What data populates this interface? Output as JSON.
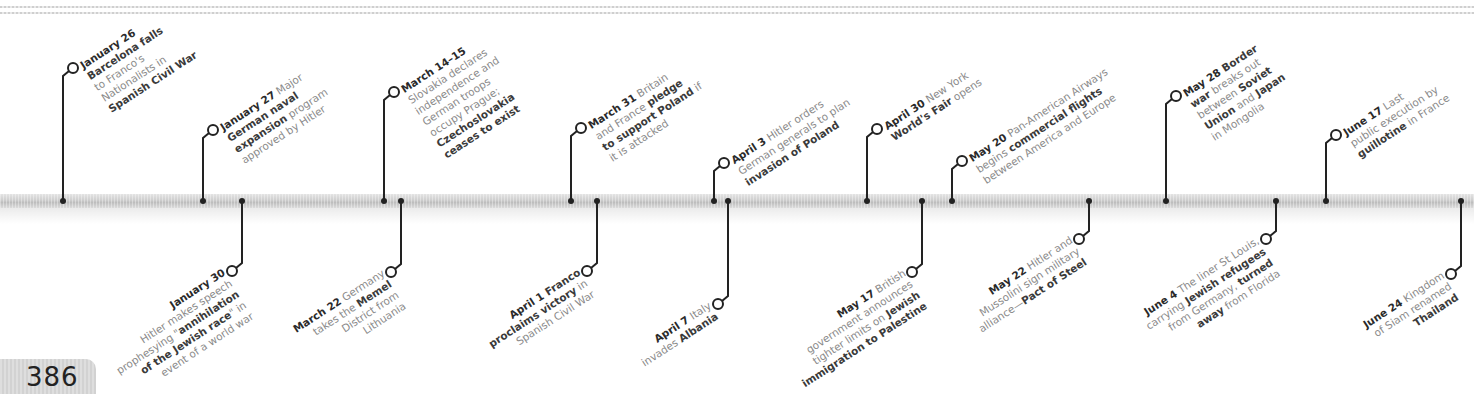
{
  "page_number": "386",
  "colors": {
    "text_bold": "#2a2a2a",
    "text_regular": "#8a8a8a",
    "bar": "#cdcdcd",
    "line": "#222222"
  },
  "events_above": [
    {
      "id": "jan26",
      "x": 63,
      "lines": [
        [
          {
            "t": "January 26",
            "s": "date"
          }
        ],
        [
          {
            "t": "Barcelona falls",
            "s": "bold"
          }
        ],
        [
          {
            "t": "to Franco's",
            "s": "reg"
          }
        ],
        [
          {
            "t": "Nationalists in",
            "s": "reg"
          }
        ],
        [
          {
            "t": "Spanish Civil War",
            "s": "bold"
          }
        ]
      ]
    },
    {
      "id": "jan27",
      "x": 203,
      "lines": [
        [
          {
            "t": "January 27",
            "s": "date"
          },
          {
            "t": " Major",
            "s": "reg"
          }
        ],
        [
          {
            "t": "German naval",
            "s": "bold"
          }
        ],
        [
          {
            "t": "expansion",
            "s": "bold"
          },
          {
            "t": " program",
            "s": "reg"
          }
        ],
        [
          {
            "t": "approved by Hitler",
            "s": "reg"
          }
        ]
      ]
    },
    {
      "id": "mar14",
      "x": 384,
      "lines": [
        [
          {
            "t": "March 14–15",
            "s": "date"
          }
        ],
        [
          {
            "t": "Slovakia declares",
            "s": "reg"
          }
        ],
        [
          {
            "t": "independence and",
            "s": "reg"
          }
        ],
        [
          {
            "t": "German troops",
            "s": "reg"
          }
        ],
        [
          {
            "t": "occupy Prague;",
            "s": "reg"
          }
        ],
        [
          {
            "t": "Czechoslovakia",
            "s": "bold"
          }
        ],
        [
          {
            "t": "ceases to exist",
            "s": "bold"
          }
        ]
      ]
    },
    {
      "id": "mar31",
      "x": 571,
      "lines": [
        [
          {
            "t": "March 31",
            "s": "date"
          },
          {
            "t": " Britain",
            "s": "reg"
          }
        ],
        [
          {
            "t": "and France ",
            "s": "reg"
          },
          {
            "t": "pledge",
            "s": "bold"
          }
        ],
        [
          {
            "t": "to support Poland",
            "s": "bold"
          },
          {
            "t": " if",
            "s": "reg"
          }
        ],
        [
          {
            "t": "it is attacked",
            "s": "reg"
          }
        ]
      ]
    },
    {
      "id": "apr3",
      "x": 714,
      "lines": [
        [
          {
            "t": "April 3",
            "s": "date"
          },
          {
            "t": " Hitler orders",
            "s": "reg"
          }
        ],
        [
          {
            "t": "German generals to plan",
            "s": "reg"
          }
        ],
        [
          {
            "t": "invasion of Poland",
            "s": "bold"
          }
        ]
      ]
    },
    {
      "id": "apr30",
      "x": 867,
      "lines": [
        [
          {
            "t": "April 30",
            "s": "date"
          },
          {
            "t": " New York",
            "s": "reg"
          }
        ],
        [
          {
            "t": "World's Fair",
            "s": "bold"
          },
          {
            "t": " opens",
            "s": "reg"
          }
        ]
      ]
    },
    {
      "id": "may20",
      "x": 952,
      "lines": [
        [
          {
            "t": "May 20",
            "s": "date"
          },
          {
            "t": " Pan-American Airways",
            "s": "reg"
          }
        ],
        [
          {
            "t": "begins ",
            "s": "reg"
          },
          {
            "t": "commercial flights",
            "s": "bold"
          }
        ],
        [
          {
            "t": "between America and Europe",
            "s": "reg"
          }
        ]
      ]
    },
    {
      "id": "may28",
      "x": 1166,
      "lines": [
        [
          {
            "t": "May 28",
            "s": "date"
          },
          {
            "t": " Border",
            "s": "bold"
          }
        ],
        [
          {
            "t": "war",
            "s": "bold"
          },
          {
            "t": " breaks out",
            "s": "reg"
          }
        ],
        [
          {
            "t": "between ",
            "s": "reg"
          },
          {
            "t": "Soviet",
            "s": "bold"
          }
        ],
        [
          {
            "t": "Union",
            "s": "bold"
          },
          {
            "t": " and ",
            "s": "reg"
          },
          {
            "t": "Japan",
            "s": "bold"
          }
        ],
        [
          {
            "t": "in Mongolia",
            "s": "reg"
          }
        ]
      ]
    },
    {
      "id": "jun17",
      "x": 1326,
      "lines": [
        [
          {
            "t": "June 17",
            "s": "date"
          },
          {
            "t": " Last",
            "s": "reg"
          }
        ],
        [
          {
            "t": "public execution by",
            "s": "reg"
          }
        ],
        [
          {
            "t": "guillotine",
            "s": "bold"
          },
          {
            "t": " in France",
            "s": "reg"
          }
        ]
      ]
    }
  ],
  "events_below": [
    {
      "id": "jan30",
      "x": 242,
      "lines": [
        [
          {
            "t": "January 30",
            "s": "date"
          }
        ],
        [
          {
            "t": "Hitler makes speech",
            "s": "reg"
          }
        ],
        [
          {
            "t": "prophesying \"",
            "s": "reg"
          },
          {
            "t": "annihilation",
            "s": "bold"
          }
        ],
        [
          {
            "t": "of the Jewish race",
            "s": "bold"
          },
          {
            "t": "\" in",
            "s": "reg"
          }
        ],
        [
          {
            "t": "event of a world war",
            "s": "reg"
          }
        ]
      ]
    },
    {
      "id": "mar22",
      "x": 401,
      "lines": [
        [
          {
            "t": "March 22",
            "s": "date"
          },
          {
            "t": " Germany",
            "s": "reg"
          }
        ],
        [
          {
            "t": "takes the ",
            "s": "reg"
          },
          {
            "t": "Memel",
            "s": "bold"
          }
        ],
        [
          {
            "t": "District from",
            "s": "reg"
          }
        ],
        [
          {
            "t": "Lithuania",
            "s": "reg"
          }
        ]
      ]
    },
    {
      "id": "apr1",
      "x": 597,
      "lines": [
        [
          {
            "t": "April 1",
            "s": "date"
          },
          {
            "t": " Franco",
            "s": "bold"
          }
        ],
        [
          {
            "t": "proclaims victory",
            "s": "bold"
          },
          {
            "t": " in",
            "s": "reg"
          }
        ],
        [
          {
            "t": "Spanish Civil War",
            "s": "reg"
          }
        ]
      ]
    },
    {
      "id": "apr7",
      "x": 728,
      "lines": [
        [
          {
            "t": "April 7",
            "s": "date"
          },
          {
            "t": " Italy",
            "s": "reg"
          }
        ],
        [
          {
            "t": "invades ",
            "s": "reg"
          },
          {
            "t": "Albania",
            "s": "bold"
          }
        ]
      ]
    },
    {
      "id": "may17",
      "x": 922,
      "lines": [
        [
          {
            "t": "May 17",
            "s": "date"
          },
          {
            "t": " British",
            "s": "reg"
          }
        ],
        [
          {
            "t": "government announces",
            "s": "reg"
          }
        ],
        [
          {
            "t": "tighter limits on ",
            "s": "reg"
          },
          {
            "t": "Jewish",
            "s": "bold"
          }
        ],
        [
          {
            "t": "immigration to Palestine",
            "s": "bold"
          }
        ]
      ]
    },
    {
      "id": "may22",
      "x": 1089,
      "lines": [
        [
          {
            "t": "May 22",
            "s": "date"
          },
          {
            "t": " Hitler and",
            "s": "reg"
          }
        ],
        [
          {
            "t": "Mussolini sign military",
            "s": "reg"
          }
        ],
        [
          {
            "t": "alliance—",
            "s": "reg"
          },
          {
            "t": "Pact of Steel",
            "s": "bold"
          }
        ]
      ]
    },
    {
      "id": "jun4",
      "x": 1276,
      "lines": [
        [
          {
            "t": "June 4",
            "s": "date"
          },
          {
            "t": " The liner St Louis,",
            "s": "reg"
          }
        ],
        [
          {
            "t": "carrying ",
            "s": "reg"
          },
          {
            "t": "Jewish refugees",
            "s": "bold"
          }
        ],
        [
          {
            "t": "from Germany, ",
            "s": "reg"
          },
          {
            "t": "turned",
            "s": "bold"
          }
        ],
        [
          {
            "t": "away",
            "s": "bold"
          },
          {
            "t": " from Florida",
            "s": "reg"
          }
        ]
      ]
    },
    {
      "id": "jun24",
      "x": 1461,
      "lines": [
        [
          {
            "t": "June 24",
            "s": "date"
          },
          {
            "t": " Kingdom",
            "s": "reg"
          }
        ],
        [
          {
            "t": "of Siam renamed",
            "s": "reg"
          }
        ],
        [
          {
            "t": "Thailand",
            "s": "bold"
          }
        ]
      ]
    }
  ],
  "layout_above": {
    "jan26": {
      "circle_y": 70
    },
    "jan27": {
      "circle_y": 132
    },
    "mar14": {
      "circle_y": 94
    },
    "mar31": {
      "circle_y": 130
    },
    "apr3": {
      "circle_y": 165
    },
    "apr30": {
      "circle_y": 131
    },
    "may20": {
      "circle_y": 163
    },
    "may28": {
      "circle_y": 98
    },
    "jun17": {
      "circle_y": 137
    }
  },
  "layout_below": {
    "jan30": {
      "circle_y": 269
    },
    "mar22": {
      "circle_y": 270
    },
    "apr1": {
      "circle_y": 269
    },
    "apr7": {
      "circle_y": 302
    },
    "may17": {
      "circle_y": 270
    },
    "may22": {
      "circle_y": 237
    },
    "jun4": {
      "circle_y": 237
    },
    "jun24": {
      "circle_y": 272
    }
  }
}
